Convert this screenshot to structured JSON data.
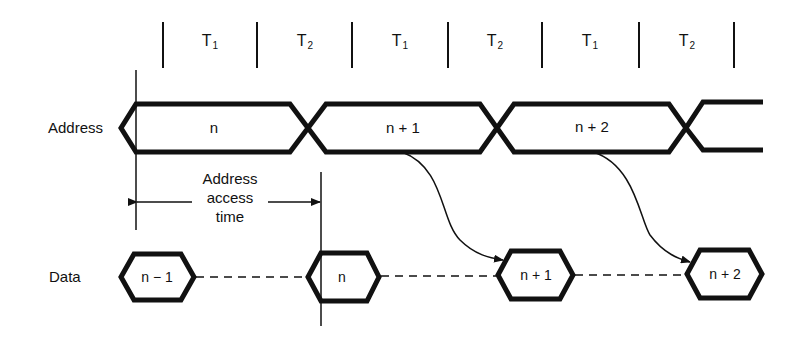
{
  "diagram": {
    "clock_periods": [
      {
        "name": "T",
        "sub": "1"
      },
      {
        "name": "T",
        "sub": "2"
      },
      {
        "name": "T",
        "sub": "1"
      },
      {
        "name": "T",
        "sub": "2"
      },
      {
        "name": "T",
        "sub": "1"
      },
      {
        "name": "T",
        "sub": "2"
      }
    ],
    "rows": {
      "address": {
        "label": "Address",
        "segments": [
          "n",
          "n + 1",
          "n + 2"
        ]
      },
      "data": {
        "label": "Data",
        "segments": [
          "n − 1",
          "n",
          "n + 1",
          "n + 2"
        ]
      }
    },
    "annotation": {
      "line1": "Address",
      "line2": "access",
      "line3": "time"
    },
    "colors": {
      "stroke": "#111111",
      "background": "#ffffff"
    }
  }
}
